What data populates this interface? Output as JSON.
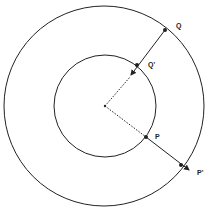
{
  "diagram": {
    "labels": {
      "Q": "Q",
      "Q_prime": "Q'",
      "P": "P",
      "P_prime": "P'"
    },
    "colors": {
      "stroke": "#222222",
      "background": "#ffffff"
    }
  }
}
